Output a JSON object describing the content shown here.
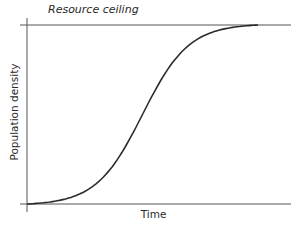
{
  "chart_data": {
    "type": "line",
    "title": "",
    "xlabel": "Time",
    "ylabel": "Population density",
    "annotations": [
      {
        "text": "Resource ceiling",
        "type": "horizontal-line",
        "y": 1.0
      }
    ],
    "series": [
      {
        "name": "Logistic growth",
        "x": [
          0,
          0.1,
          0.2,
          0.3,
          0.4,
          0.5,
          0.6,
          0.7,
          0.8,
          0.9,
          1.0
        ],
        "values": [
          0.0,
          0.02,
          0.08,
          0.2,
          0.4,
          0.6,
          0.8,
          0.92,
          0.98,
          1.0,
          1.0
        ]
      }
    ],
    "xlim": [
      0,
      1.15
    ],
    "ylim": [
      0,
      1.0
    ],
    "grid": false,
    "legend": "none",
    "ticks": false
  },
  "labels": {
    "ceiling": "Resource ceiling",
    "x_axis": "Time",
    "y_axis": "Population density"
  },
  "colors": {
    "axis": "#555555",
    "curve": "#2b2b2b",
    "text": "#2a2a2a"
  }
}
